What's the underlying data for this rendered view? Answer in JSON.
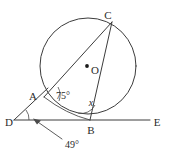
{
  "diagram": {
    "type": "circle-geometry",
    "background_color": "#ffffff",
    "stroke_color": "#3c3c3c",
    "circle": {
      "center_label": "O",
      "center_x": 88,
      "center_y": 66,
      "radius": 48
    },
    "points": [
      {
        "id": "A",
        "label": "A",
        "x": 44,
        "y": 97,
        "label_x": 30,
        "label_y": 95
      },
      {
        "id": "B",
        "label": "B",
        "x": 90,
        "y": 120,
        "label_x": 86,
        "label_y": 133
      },
      {
        "id": "C",
        "label": "C",
        "x": 112,
        "y": 22,
        "label_x": 108,
        "label_y": 17
      },
      {
        "id": "D",
        "label": "D",
        "x": 14,
        "y": 120,
        "label_x": 5,
        "label_y": 126
      },
      {
        "id": "E",
        "label": "E",
        "x": 150,
        "y": 120,
        "label_x": 152,
        "label_y": 126
      },
      {
        "id": "O",
        "label": "O",
        "x": 88,
        "y": 66,
        "label_x": 92,
        "label_y": 74
      }
    ],
    "segments": [
      {
        "id": "line-DE",
        "from": "D",
        "to": "E",
        "name": "tangent-line-DE"
      },
      {
        "id": "chord-AC",
        "from": "A",
        "to": "C",
        "name": "chord-ac"
      },
      {
        "id": "chord-CB",
        "from": "C",
        "to": "B",
        "name": "chord-cb"
      },
      {
        "id": "chord-AB",
        "from": "A",
        "to": "B",
        "name": "chord-ab"
      },
      {
        "id": "secant-DA",
        "from": "D",
        "to": "A",
        "name": "secant-da"
      }
    ],
    "angles": [
      {
        "id": "angle-at-A",
        "value": "75°",
        "vertex": "A",
        "label_x": 57,
        "label_y": 96
      },
      {
        "id": "angle-at-B",
        "value": "x",
        "vertex": "B",
        "label_x": 88,
        "label_y": 105
      },
      {
        "id": "angle-at-D",
        "value": "49°",
        "vertex": "D",
        "label_x": 63,
        "label_y": 146
      }
    ],
    "annotations": [
      {
        "id": "leader-line-49",
        "name": "leader-arrow-to-angle-d",
        "from_x": 62,
        "from_y": 140,
        "to_x": 33,
        "to_y": 119
      }
    ]
  }
}
